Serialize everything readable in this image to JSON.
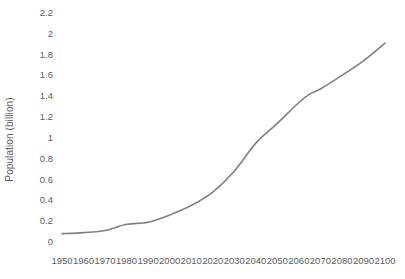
{
  "chart_data": {
    "type": "line",
    "title": "",
    "xlabel": "",
    "ylabel": "Population (billion)",
    "xlim": [
      1950,
      2100
    ],
    "ylim": [
      0,
      2.2
    ],
    "grid": false,
    "legend": false,
    "legend_position": "none",
    "line_color": "#808080",
    "line_width": 1.6,
    "x_tick_labels": [
      "1950",
      "1960",
      "1970",
      "1980",
      "1990",
      "2000",
      "2010",
      "2020",
      "2030",
      "2040",
      "2050",
      "2060",
      "2070",
      "2080",
      "2090",
      "2100"
    ],
    "y_tick_labels": [
      "0",
      "0.2",
      "0.4",
      "0.6",
      "0.8",
      "1",
      "1.2",
      "1.4",
      "1.6",
      "1.8",
      "2",
      "2.2"
    ],
    "y_tick_values": [
      0,
      0.2,
      0.4,
      0.6,
      0.8,
      1,
      1.2,
      1.4,
      1.6,
      1.8,
      2,
      2.2
    ],
    "x": [
      1950,
      1960,
      1970,
      1980,
      1990,
      2000,
      2010,
      2020,
      2030,
      2040,
      2050,
      2060,
      2065,
      2070,
      2080,
      2090,
      2100
    ],
    "values": [
      0.08,
      0.09,
      0.11,
      0.17,
      0.19,
      0.26,
      0.35,
      0.48,
      0.68,
      0.95,
      1.14,
      1.34,
      1.42,
      1.47,
      1.6,
      1.74,
      1.91
    ],
    "series": [
      {
        "name": "Population",
        "values": [
          0.08,
          0.09,
          0.11,
          0.17,
          0.19,
          0.26,
          0.35,
          0.48,
          0.68,
          0.95,
          1.14,
          1.34,
          1.42,
          1.47,
          1.6,
          1.74,
          1.91
        ]
      }
    ]
  },
  "axes": {
    "y_title": "Population (billion)"
  }
}
